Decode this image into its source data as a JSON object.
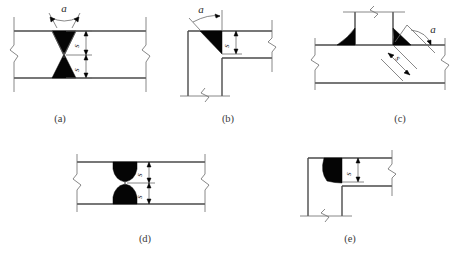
{
  "document": {
    "title": "Welded joint cross-section types",
    "background_color": "#ffffff",
    "line_color": "#555555",
    "weld_fill_color": "#050505",
    "text_color": "#2a2a2a"
  },
  "figures": [
    {
      "id": "a",
      "caption": "(a)",
      "joint_type": "butt-joint-double-v-groove",
      "description": "Double-V groove butt weld between two plates",
      "angle_label": "a",
      "dimension_labels": [
        "s",
        "s"
      ],
      "weld_count": 2,
      "has_break_lines": true
    },
    {
      "id": "b",
      "caption": "(b)",
      "joint_type": "corner-joint-single-bevel-groove",
      "description": "Corner joint with single bevel groove weld",
      "angle_label": "a",
      "dimension_labels": [
        "s"
      ],
      "weld_count": 1,
      "has_break_lines": true
    },
    {
      "id": "c",
      "caption": "(c)",
      "joint_type": "tee-joint-double-fillet",
      "description": "Tee joint with fillet welds on both sides",
      "angle_label": "a",
      "dimension_labels": [
        "s"
      ],
      "weld_count": 2,
      "has_break_lines": true
    },
    {
      "id": "d",
      "caption": "(d)",
      "joint_type": "butt-joint-double-u-groove",
      "description": "Double-U groove butt weld between two plates",
      "angle_label": null,
      "dimension_labels": [
        "s",
        "s"
      ],
      "weld_count": 2,
      "has_break_lines": true
    },
    {
      "id": "e",
      "caption": "(e)",
      "joint_type": "corner-joint-j-groove",
      "description": "Corner joint with J groove weld",
      "angle_label": null,
      "dimension_labels": [
        "s"
      ],
      "weld_count": 1,
      "has_break_lines": true
    }
  ],
  "captions": {
    "a": "(a)",
    "b": "(b)",
    "c": "(c)",
    "d": "(d)",
    "e": "(e)"
  },
  "symbols": {
    "angle": "a",
    "throat_thickness": "s"
  }
}
